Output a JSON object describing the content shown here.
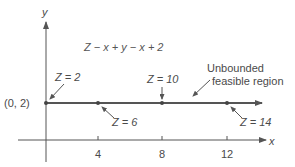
{
  "diagram": {
    "equation": "Z − x + y − x + 2",
    "axes": {
      "x_label": "x",
      "y_label": "y",
      "x_ticks": [
        "4",
        "8",
        "12"
      ]
    },
    "start_point_label": "(0, 2)",
    "region_label_line1": "Unbounded",
    "region_label_line2": "feasible region",
    "points": [
      {
        "x": 0,
        "y": 2,
        "label": "Z = 2"
      },
      {
        "x": 4,
        "y": 2,
        "label": "Z = 6"
      },
      {
        "x": 8,
        "y": 2,
        "label": "Z = 10"
      },
      {
        "x": 12,
        "y": 2,
        "label": "Z = 14"
      }
    ],
    "colors": {
      "line": "#555555",
      "text": "#4a4a4a"
    }
  }
}
